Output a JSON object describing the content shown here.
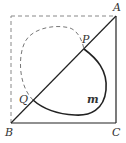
{
  "diagram": {
    "type": "geometry-figure",
    "labels": {
      "A": "A",
      "B": "B",
      "C": "C",
      "P": "P",
      "Q": "Q",
      "m": "m"
    },
    "points": {
      "A": [
        116,
        16
      ],
      "B": [
        11,
        123
      ],
      "C": [
        116,
        123
      ],
      "P": [
        84,
        49
      ],
      "Q": [
        33,
        100
      ],
      "D": [
        11,
        16
      ]
    },
    "elements": [
      {
        "kind": "segment",
        "from": "B",
        "to": "A",
        "style": "solid"
      },
      {
        "kind": "segment",
        "from": "A",
        "to": "C",
        "style": "solid"
      },
      {
        "kind": "segment",
        "from": "B",
        "to": "C",
        "style": "solid"
      },
      {
        "kind": "segment",
        "from": "B",
        "to": "D",
        "style": "dashed"
      },
      {
        "kind": "segment",
        "from": "D",
        "to": "A",
        "style": "dashed"
      },
      {
        "kind": "curve",
        "name": "m",
        "from": "P",
        "to": "Q",
        "side": "below-diagonal",
        "style": "solid"
      },
      {
        "kind": "curve",
        "from": "Q",
        "to": "P",
        "side": "above-diagonal",
        "style": "dashed"
      }
    ],
    "colors": {
      "line": "#222222",
      "dashed": "#777777",
      "label": "#333333"
    },
    "caption": ""
  }
}
